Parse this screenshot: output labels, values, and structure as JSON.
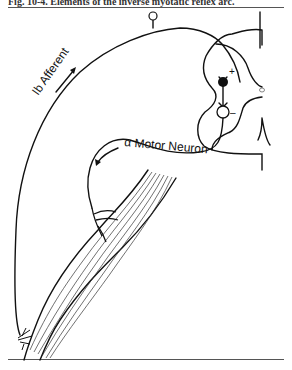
{
  "figure": {
    "caption": "Fig. 10-4. Elements of the inverse myotatic reflex arc."
  },
  "labels": {
    "afferent": "Ib Afferent",
    "motor": "α Motor Neuron",
    "plus": "+",
    "minus": "–"
  },
  "colors": {
    "ink": "#111111",
    "rule": "#555555"
  }
}
